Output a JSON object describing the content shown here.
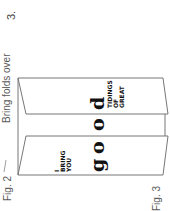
{
  "step": {
    "number": "3."
  },
  "captions": {
    "instruction": "Bring folds over",
    "fig_left": "Fig. 2",
    "fig_right": "Fig. 3"
  },
  "card": {
    "left_panel_text": [
      "I",
      "BRING",
      "YOU"
    ],
    "right_panel_text": [
      "TIDINGS",
      "OF",
      "GREAT"
    ],
    "center_word_letters": [
      "g",
      "o",
      "o",
      "d"
    ],
    "line_color": "#777777",
    "ink_color": "#111111"
  }
}
